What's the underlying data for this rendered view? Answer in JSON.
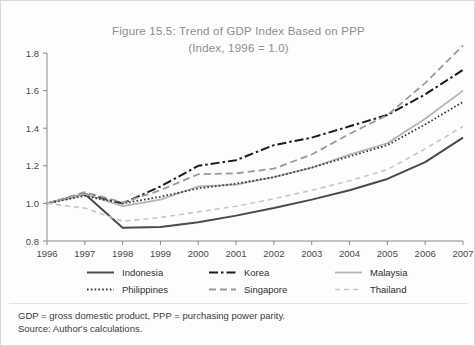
{
  "figure": {
    "title_line1": "Figure 15.5: Trend of GDP Index Based on PPP",
    "title_line2": "(Index, 1996 = 1.0)",
    "note_line1": "GDP = gross domestic product, PPP = purchasing power parity.",
    "note_line2": "Source: Author's calculations."
  },
  "chart_data": {
    "type": "line",
    "title": "Figure 15.5: Trend of GDP Index Based on PPP",
    "subtitle": "(Index, 1996 = 1.0)",
    "xlabel": "",
    "ylabel": "",
    "x": [
      1996,
      1997,
      1998,
      1999,
      2000,
      2001,
      2002,
      2003,
      2004,
      2005,
      2006,
      2007
    ],
    "categories": [
      "1996",
      "1997",
      "1998",
      "1999",
      "2000",
      "2001",
      "2002",
      "2003",
      "2004",
      "2005",
      "2006",
      "2007"
    ],
    "xlim": [
      1996,
      2007
    ],
    "ylim": [
      0.8,
      1.8
    ],
    "yticks": [
      0.8,
      1.0,
      1.2,
      1.4,
      1.6,
      1.8
    ],
    "ytick_labels": [
      "0.8",
      "1.0",
      "1.2",
      "1.4",
      "1.6",
      "1.8"
    ],
    "grid": false,
    "legend_position": "below",
    "series": [
      {
        "name": "Indonesia",
        "color": "#4a4a4a",
        "dash": "none",
        "width": 2.0,
        "values": [
          1.0,
          1.05,
          0.87,
          0.875,
          0.9,
          0.935,
          0.975,
          1.02,
          1.07,
          1.13,
          1.22,
          1.35
        ]
      },
      {
        "name": "Korea",
        "color": "#1c1c1c",
        "dash": "dashdot",
        "width": 2.0,
        "values": [
          1.0,
          1.05,
          1.0,
          1.09,
          1.2,
          1.23,
          1.31,
          1.35,
          1.41,
          1.47,
          1.58,
          1.71
        ]
      },
      {
        "name": "Malaysia",
        "color": "#b4b4b4",
        "dash": "none",
        "width": 1.8,
        "values": [
          1.0,
          1.05,
          0.985,
          1.02,
          1.09,
          1.1,
          1.14,
          1.19,
          1.26,
          1.32,
          1.45,
          1.6
        ]
      },
      {
        "name": "Philippines",
        "color": "#3a3a3a",
        "dash": "dotted",
        "width": 1.8,
        "values": [
          1.0,
          1.04,
          1.0,
          1.035,
          1.08,
          1.105,
          1.14,
          1.19,
          1.25,
          1.31,
          1.42,
          1.54
        ]
      },
      {
        "name": "Singapore",
        "color": "#9a9a9a",
        "dash": "dashed",
        "width": 1.8,
        "values": [
          1.0,
          1.06,
          1.005,
          1.07,
          1.155,
          1.16,
          1.185,
          1.26,
          1.37,
          1.47,
          1.64,
          1.84
        ]
      },
      {
        "name": "Thailand",
        "color": "#c6c6c6",
        "dash": "dashed-light",
        "width": 1.6,
        "values": [
          1.0,
          0.975,
          0.905,
          0.925,
          0.955,
          0.985,
          1.025,
          1.07,
          1.12,
          1.18,
          1.29,
          1.41
        ]
      }
    ]
  },
  "legend": {
    "items": [
      {
        "label": "Indonesia"
      },
      {
        "label": "Korea"
      },
      {
        "label": "Malaysia"
      },
      {
        "label": "Philippines"
      },
      {
        "label": "Singapore"
      },
      {
        "label": "Thailand"
      }
    ]
  }
}
